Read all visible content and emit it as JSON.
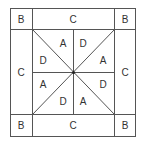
{
  "diagram": {
    "type": "quilt-block-layout",
    "stroke_color": "#555555",
    "corners": [
      {
        "id": "top-left",
        "label": "B"
      },
      {
        "id": "top-right",
        "label": "B"
      },
      {
        "id": "bottom-left",
        "label": "B"
      },
      {
        "id": "bottom-right",
        "label": "B"
      }
    ],
    "borders": [
      {
        "id": "top",
        "label": "C"
      },
      {
        "id": "left",
        "label": "C"
      },
      {
        "id": "right",
        "label": "C"
      },
      {
        "id": "bottom",
        "label": "C"
      }
    ],
    "center_triangles": [
      {
        "id": "top-left-upper",
        "label": "A"
      },
      {
        "id": "top-right-upper",
        "label": "D"
      },
      {
        "id": "left-upper",
        "label": "D"
      },
      {
        "id": "right-upper",
        "label": "A"
      },
      {
        "id": "left-lower",
        "label": "A"
      },
      {
        "id": "right-lower",
        "label": "D"
      },
      {
        "id": "bottom-left-lower",
        "label": "D"
      },
      {
        "id": "bottom-right-lower",
        "label": "A"
      }
    ]
  }
}
